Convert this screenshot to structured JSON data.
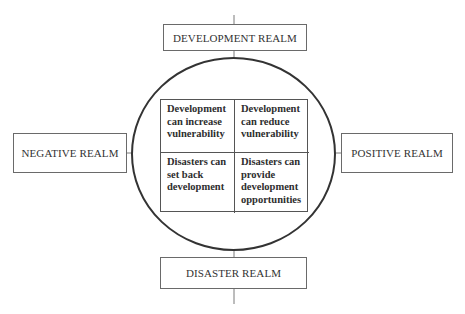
{
  "diagram": {
    "realms": {
      "top": "DEVELOPMENT REALM",
      "bottom": "DISASTER REALM",
      "left": "NEGATIVE REALM",
      "right": "POSITIVE REALM"
    },
    "quadrants": {
      "top_left": [
        "Development",
        "can increase",
        "vulnerability"
      ],
      "top_right": [
        "Development",
        "can reduce",
        "vulnerability"
      ],
      "bottom_left": [
        "Disasters can",
        "set back",
        "development"
      ],
      "bottom_right": [
        "Disasters can",
        "provide",
        "development",
        "opportunities"
      ]
    },
    "colors": {
      "line": "#555555",
      "circle": "#333333",
      "text": "#2e2e2e",
      "background": "#ffffff"
    }
  }
}
